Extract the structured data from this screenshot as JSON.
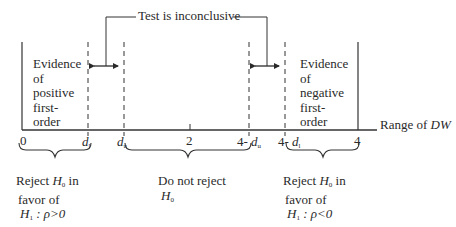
{
  "diagram": {
    "title_callout": "Test is inconclusive",
    "axis_label": "Range of DW",
    "axis_label_prefix": "Range of ",
    "axis_label_var": "DW",
    "ticks": {
      "zero": "0",
      "dl": "d",
      "dl_sub": "l",
      "du": "d",
      "du_sub": "u",
      "two": "2",
      "four_minus_du_prefix": "4- ",
      "four_minus_du_var": "d",
      "four_minus_du_sub": "u",
      "four_minus_dl_prefix": "4- ",
      "four_minus_dl_var": "d",
      "four_minus_dl_sub": "l",
      "four": "4"
    },
    "regions": {
      "positive": {
        "lines": [
          "Evidence",
          "of",
          "positive",
          "first-",
          "order"
        ]
      },
      "negative": {
        "lines": [
          "Evidence",
          "of",
          "negative",
          "first-",
          "order"
        ]
      }
    },
    "decisions": {
      "reject_positive": {
        "line1_prefix": "Reject ",
        "line1_var": "H",
        "line1_sub": "0",
        "line1_suffix": " in",
        "line2": "favor of",
        "line3_var": "H",
        "line3_sub": "1",
        "line3_rest": " : ρ>0"
      },
      "do_not_reject": {
        "line1": "Do not reject",
        "line2_var": "H",
        "line2_sub": "0"
      },
      "reject_negative": {
        "line1_prefix": "Reject ",
        "line1_var": "H",
        "line1_sub": "0",
        "line1_suffix": " in",
        "line2": "favor of",
        "line3_var": "H",
        "line3_sub": "1",
        "line3_rest": " : ρ<0"
      }
    }
  }
}
